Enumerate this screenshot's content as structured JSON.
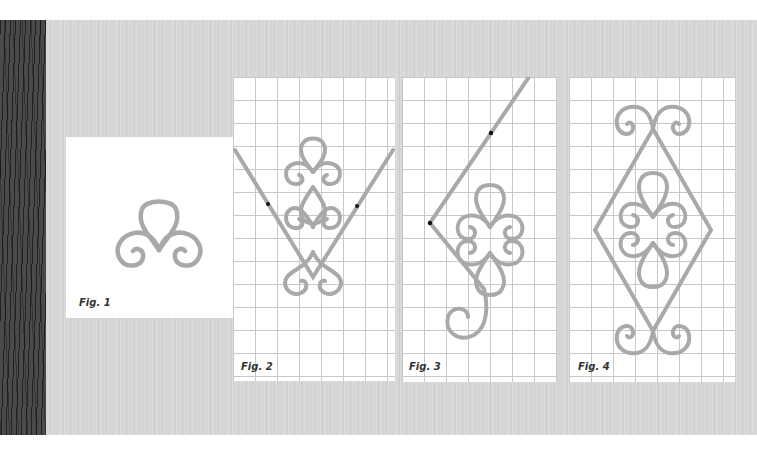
{
  "colors": {
    "board": "#d6d6d6",
    "dark_strip": "#4a4a4a",
    "panel": "#ffffff",
    "grid_line": "#c8c8c8",
    "scroll_stroke": "#a9a9a9",
    "marker": "#111111",
    "label": "#333333"
  },
  "figures": [
    {
      "id": 1,
      "label": "Fig. 1",
      "background": "plain",
      "description": "Single trefoil scroll: one top loop with two curled side scrolls"
    },
    {
      "id": 2,
      "label": "Fig. 2",
      "background": "grid",
      "description": "Stacked scroll motif placed within a V-shaped bar with two marked points"
    },
    {
      "id": 3,
      "label": "Fig. 3",
      "background": "grid",
      "description": "Scroll motif against an angled bar bent into a corner, with two marked points"
    },
    {
      "id": 4,
      "label": "Fig. 4",
      "background": "grid",
      "description": "Completed diamond frame enclosing stacked scrolls, with scroll pairs at top and bottom"
    }
  ]
}
